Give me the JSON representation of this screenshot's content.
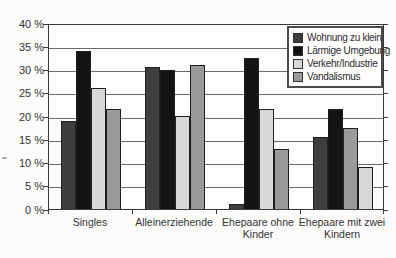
{
  "figure": {
    "background": "#fbfbfa",
    "text_color": "#333333",
    "grid_color": "#6a6a6a",
    "axis_color": "#3a3a3a"
  },
  "chart_data": {
    "type": "bar",
    "title": "",
    "xlabel": "",
    "ylabel": "",
    "ylim": [
      0,
      40
    ],
    "ytick_step": 5,
    "grid": "horizontal",
    "legend_position": "top-right-inside",
    "yticks": [
      {
        "value": 0,
        "label": "0 %"
      },
      {
        "value": 5,
        "label": "5 %"
      },
      {
        "value": 10,
        "label": "10 %"
      },
      {
        "value": 15,
        "label": "15 %"
      },
      {
        "value": 20,
        "label": "20 %"
      },
      {
        "value": 25,
        "label": "25 %"
      },
      {
        "value": 30,
        "label": "30 %"
      },
      {
        "value": 35,
        "label": "35 %"
      },
      {
        "value": 40,
        "label": "40 %"
      }
    ],
    "categories": [
      "Singles",
      "Alleinerziehende",
      "Ehepaare ohne Kinder",
      "Ehepaare mit zwei Kindern"
    ],
    "series": [
      {
        "name": "Wohnung zu klein",
        "color": "#3e3e3e",
        "values": [
          19,
          30.5,
          1,
          15.5
        ]
      },
      {
        "name": "Lärmige Umgebung",
        "color": "#141414",
        "values": [
          34,
          30,
          32.5,
          21.5
        ]
      },
      {
        "name": "Verkehr/Industrie",
        "color": "#d8d8d8",
        "values": [
          26,
          20,
          21.5,
          9
        ]
      },
      {
        "name": "Vandalismus",
        "color": "#9a9a9a",
        "values": [
          21.5,
          31,
          13,
          17.5
        ]
      }
    ],
    "bar_series_order_by_group": [
      [
        0,
        1,
        2,
        3
      ],
      [
        0,
        1,
        2,
        3
      ],
      [
        0,
        1,
        2,
        3
      ],
      [
        0,
        1,
        3,
        2
      ]
    ]
  }
}
